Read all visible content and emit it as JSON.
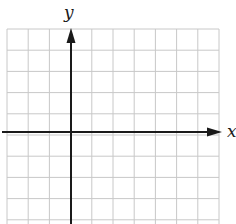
{
  "diagram": {
    "type": "coordinate-grid",
    "axes": {
      "x_label": "x",
      "y_label": "y"
    },
    "grid": {
      "columns": 10,
      "rows": 10,
      "origin_column": 3,
      "origin_row": 5,
      "grid_color": "#c8c8c8",
      "axis_color": "#1a1a1a"
    }
  }
}
